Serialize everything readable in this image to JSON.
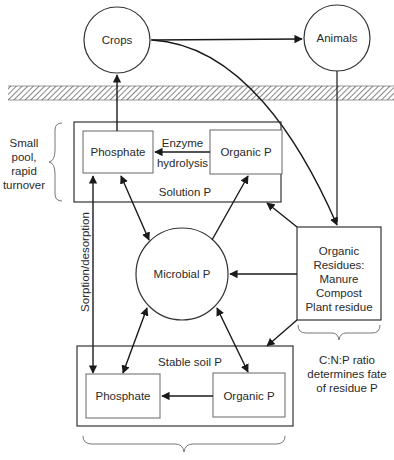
{
  "nodes": {
    "crops": "Crops",
    "animals": "Animals",
    "solution_phosphate": "Phosphate",
    "solution_organic": "Organic P",
    "solution_pool": "Solution P",
    "enzyme_line1": "Enzyme",
    "enzyme_line2": "hydrolysis",
    "microbial": "Microbial P",
    "residues": [
      "Organic",
      "Residues:",
      "Manure",
      "Compost",
      "Plant residue"
    ],
    "stable_pool": "Stable soil P",
    "stable_phosphate": "Phosphate",
    "stable_organic": "Organic P"
  },
  "annotations": {
    "small_pool": [
      "Small",
      "pool,",
      "rapid",
      "turnover"
    ],
    "sorption": "Sorption/desorption",
    "cnp": [
      "C:N:P ratio",
      "determines fate",
      "of residue P"
    ]
  },
  "colors": {
    "line": "#1a1a1a",
    "box": "#444444",
    "brace": "#777777"
  }
}
